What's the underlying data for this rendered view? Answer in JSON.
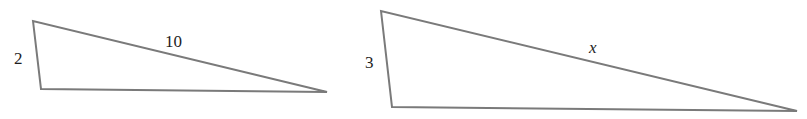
{
  "diagram": {
    "line_color": "#7a7a7a",
    "text_color": "#1e1e1e",
    "triangles": [
      {
        "id": "triangle-1",
        "vertices": {
          "top": [
            33,
            21
          ],
          "bottom_left": [
            41,
            89
          ],
          "right": [
            327,
            92
          ]
        },
        "labels": {
          "short_side": "2",
          "hypotenuse": "10"
        }
      },
      {
        "id": "triangle-2",
        "vertices": {
          "top": [
            381,
            11
          ],
          "bottom_left": [
            392,
            107
          ],
          "right": [
            797,
            111
          ]
        },
        "labels": {
          "short_side": "3",
          "hypotenuse": "x"
        }
      }
    ]
  }
}
